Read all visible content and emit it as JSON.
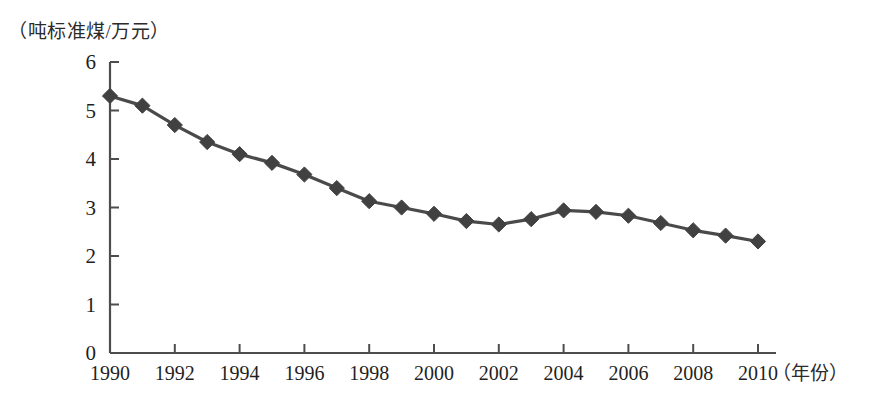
{
  "chart_data": {
    "type": "line",
    "title": "",
    "subtitle": "",
    "ylabel": "（吨标准煤/万元）",
    "xlabel": "（年份）",
    "x": [
      1990,
      1991,
      1992,
      1993,
      1994,
      1995,
      1996,
      1997,
      1998,
      1999,
      2000,
      2001,
      2002,
      2003,
      2004,
      2005,
      2006,
      2007,
      2008,
      2009,
      2010
    ],
    "values": [
      5.3,
      5.1,
      4.7,
      4.35,
      4.1,
      3.92,
      3.68,
      3.4,
      3.13,
      3.0,
      2.87,
      2.72,
      2.65,
      2.76,
      2.94,
      2.91,
      2.83,
      2.68,
      2.53,
      2.42,
      2.3
    ],
    "series": [
      {
        "name": "单位GDP能耗",
        "values": [
          5.3,
          5.1,
          4.7,
          4.35,
          4.1,
          3.92,
          3.68,
          3.4,
          3.13,
          3.0,
          2.87,
          2.72,
          2.65,
          2.76,
          2.94,
          2.91,
          2.83,
          2.68,
          2.53,
          2.42,
          2.3
        ]
      }
    ],
    "ylim": [
      0,
      6
    ],
    "xlim": [
      1990,
      2010
    ],
    "yticks": [
      0,
      1,
      2,
      3,
      4,
      5,
      6
    ],
    "ytick_labels": [
      "0",
      "1",
      "2",
      "3",
      "4",
      "5",
      "6"
    ],
    "xticks": [
      1990,
      1992,
      1994,
      1996,
      1998,
      2000,
      2002,
      2004,
      2006,
      2008,
      2010
    ],
    "xtick_labels": [
      "1990",
      "1992",
      "1994",
      "1996",
      "1998",
      "2000",
      "2002",
      "2004",
      "2006",
      "2008",
      "2010"
    ],
    "grid": false,
    "legend": "none",
    "marker": "diamond",
    "line_color": "#4a4a4a",
    "marker_color": "#414141",
    "axis_color": "#4d4d4d",
    "background": "#ffffff"
  }
}
